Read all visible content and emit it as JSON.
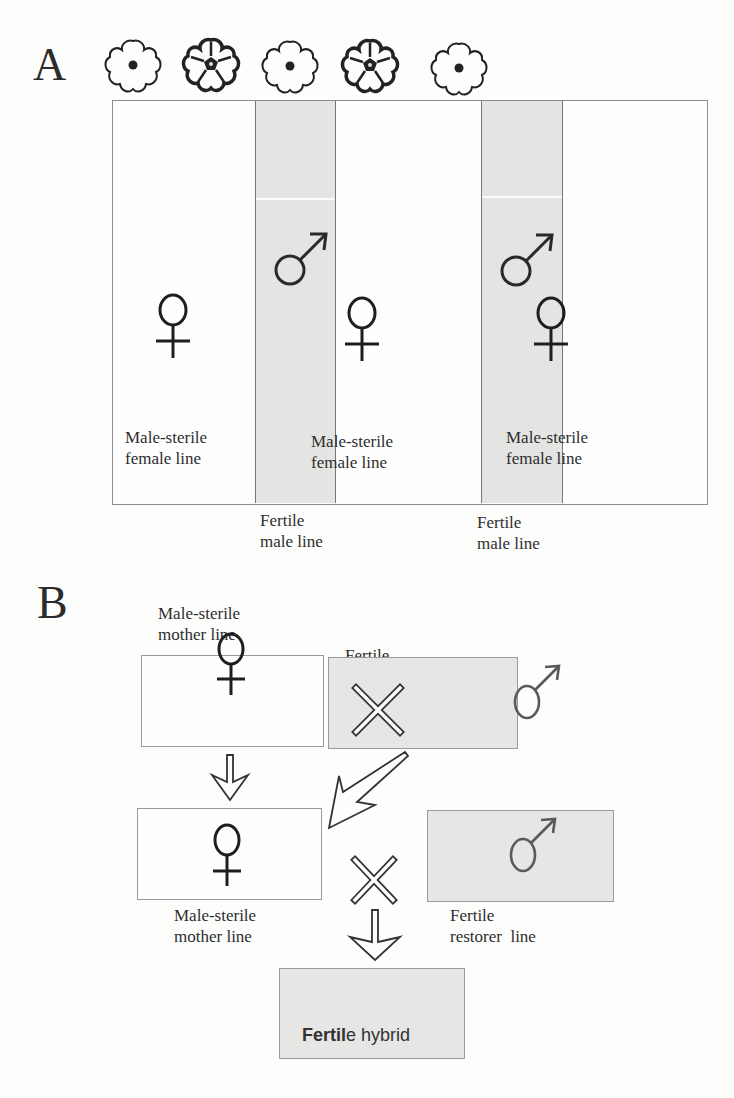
{
  "panel_a": {
    "letter": "A",
    "flowers": [
      {
        "type": "female-flower"
      },
      {
        "type": "male-flower"
      },
      {
        "type": "female-flower"
      },
      {
        "type": "male-flower"
      },
      {
        "type": "female-flower"
      }
    ],
    "rows": [
      {
        "kind": "female",
        "label_line1": "Male-sterile",
        "label_line2": "female line"
      },
      {
        "kind": "male",
        "label_line1": "Fertile",
        "label_line2": "male line"
      },
      {
        "kind": "female",
        "label_line1": "Male-sterile",
        "label_line2": "female line"
      },
      {
        "kind": "male",
        "label_line1": "Fertile",
        "label_line2": "male line"
      },
      {
        "kind": "female",
        "label_line1": "Male-sterile",
        "label_line2": "female line"
      }
    ],
    "colors": {
      "female_stripe": "#fefefe",
      "male_stripe": "#e4e4e2"
    }
  },
  "panel_b": {
    "letter": "B",
    "mother_top": {
      "line1": "Male-sterile",
      "line2": "mother line",
      "symbol": "female"
    },
    "maintainer": {
      "line1": "Fertile",
      "line2": "maintainer  line",
      "symbol": "male"
    },
    "mother_bottom": {
      "line1": "Male-sterile",
      "line2": "mother line",
      "symbol": "female"
    },
    "restorer": {
      "line1": "Fertile",
      "line2": "restorer  line",
      "symbol": "male"
    },
    "cross_symbol": "×",
    "hybrid": {
      "bold": "Fertil",
      "rest_e": "e",
      "rest": " hybrid"
    },
    "colors": {
      "gray_box": "#e6e6e4",
      "white_box": "#fefefe"
    }
  }
}
